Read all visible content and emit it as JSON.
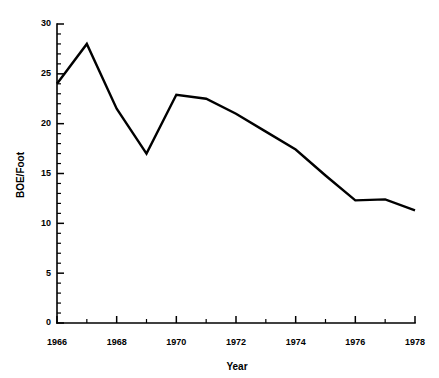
{
  "chart_data": {
    "type": "line",
    "title": "",
    "xlabel": "Year",
    "ylabel": "BOE/Foot",
    "xlim": [
      1966,
      1978
    ],
    "ylim": [
      0,
      30
    ],
    "grid": false,
    "legend": "none",
    "x_major_ticks": [
      1966,
      1968,
      1970,
      1972,
      1974,
      1976,
      1978
    ],
    "x_major_tick_labels": [
      "1966",
      "1968",
      "1970",
      "1972",
      "1974",
      "1976",
      "1978"
    ],
    "x_minor_tick_interval": 1,
    "y_major_ticks": [
      0,
      5,
      10,
      15,
      20,
      25,
      30
    ],
    "y_major_tick_labels": [
      "0",
      "5",
      "10",
      "15",
      "20",
      "25",
      "30"
    ],
    "y_minor_tick_interval": 1,
    "line_color": "#000000",
    "series": [
      {
        "name": "BOE/Foot",
        "x": [
          1966,
          1967,
          1968,
          1969,
          1970,
          1971,
          1972,
          1973,
          1974,
          1975,
          1976,
          1977,
          1978
        ],
        "values": [
          24.0,
          28.0,
          21.5,
          17.0,
          22.9,
          22.5,
          21.0,
          19.2,
          17.4,
          14.8,
          12.3,
          12.4,
          11.3
        ]
      }
    ]
  },
  "axis_titles": {
    "x": "Year",
    "y": "BOE/Foot"
  }
}
